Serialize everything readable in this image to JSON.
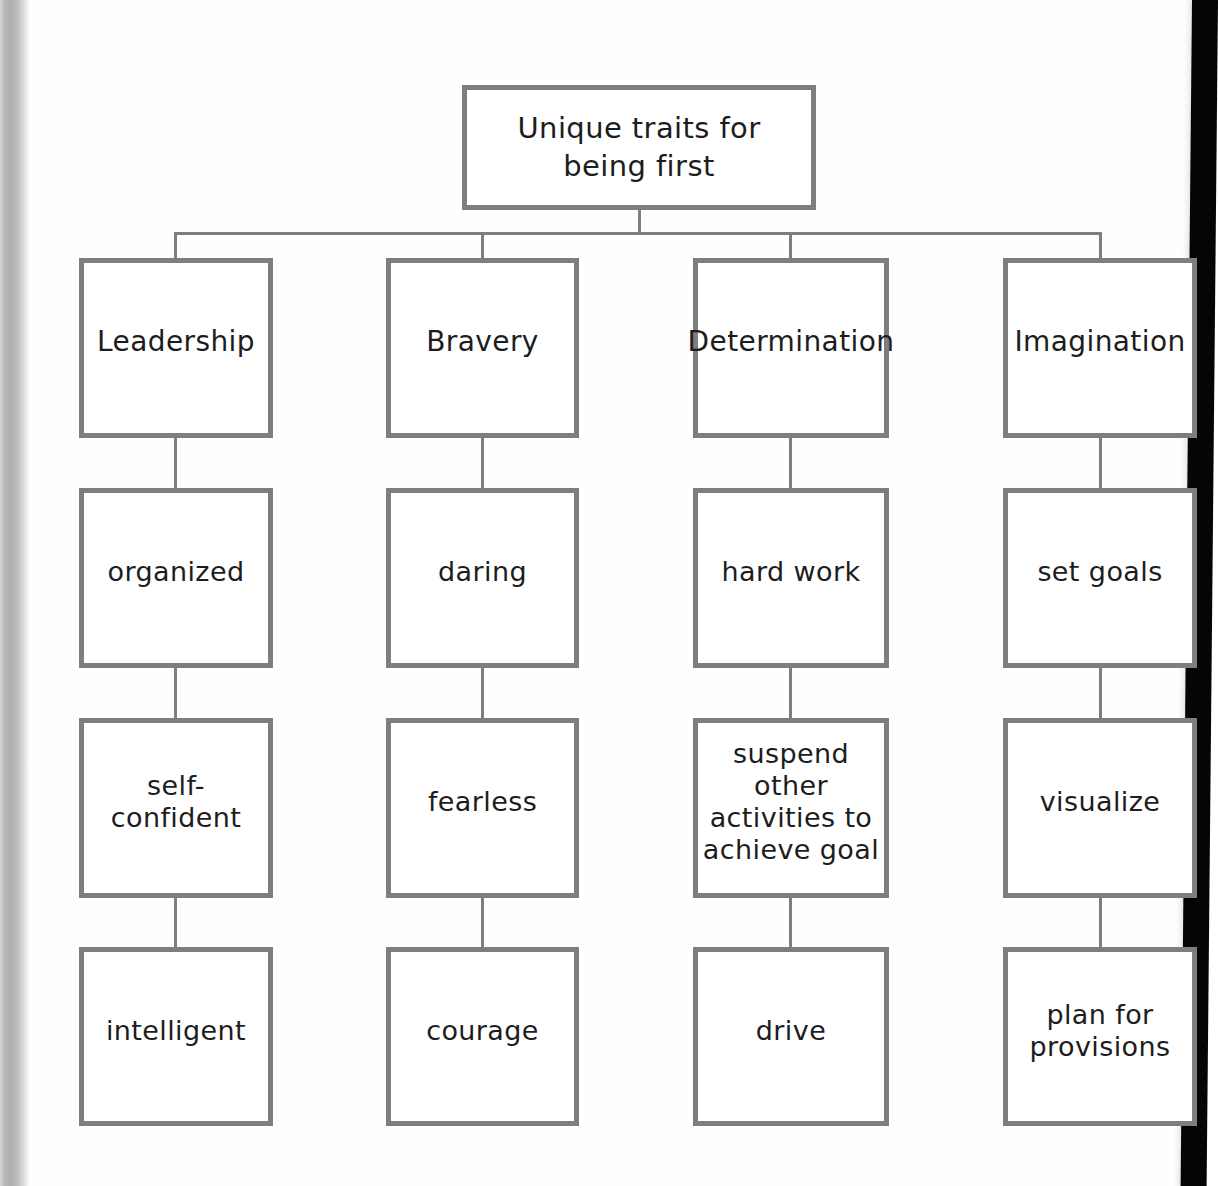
{
  "diagram": {
    "type": "tree-org-chart",
    "root": {
      "label": "Unique traits for\nbeing first"
    },
    "branches": [
      {
        "heading": "Leadership",
        "items": [
          "organized",
          "self-\nconfident",
          "intelligent"
        ]
      },
      {
        "heading": "Bravery",
        "items": [
          "daring",
          "fearless",
          "courage"
        ]
      },
      {
        "heading": "Determination",
        "items": [
          "hard work",
          "suspend\nother\nactivities to\nachieve goal",
          "drive"
        ]
      },
      {
        "heading": "Imagination",
        "items": [
          "set goals",
          "visualize",
          "plan for\nprovisions"
        ]
      }
    ],
    "style": {
      "border_color": "#7e7e7e",
      "box_fill": "#ffffff",
      "text_color": "#1d1d1d",
      "page_background": "#ffffff"
    }
  }
}
